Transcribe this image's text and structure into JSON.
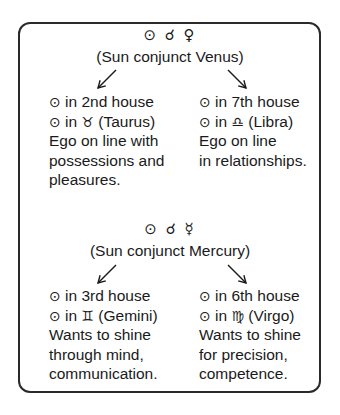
{
  "diagram": {
    "sections": [
      {
        "symbols": "⊙ ☌ ♀",
        "title": "(Sun conjunct Venus)",
        "left": {
          "house_glyph": "⊙",
          "house_text": " in 2nd house",
          "sign_glyph": "⊙",
          "sign_in": " in ",
          "sign_symbol": "♉",
          "sign_name": " (Taurus)",
          "description": [
            "Ego on line with",
            "possessions and",
            "pleasures."
          ]
        },
        "right": {
          "house_glyph": "⊙",
          "house_text": " in 7th house",
          "sign_glyph": "⊙",
          "sign_in": " in ",
          "sign_symbol": "♎",
          "sign_name": " (Libra)",
          "description": [
            "Ego on line",
            "in relationships."
          ]
        }
      },
      {
        "symbols": "⊙ ☌ ☿",
        "title": "(Sun conjunct Mercury)",
        "left": {
          "house_glyph": "⊙",
          "house_text": " in 3rd house",
          "sign_glyph": "⊙",
          "sign_in": " in ",
          "sign_symbol": "♊",
          "sign_name": " (Gemini)",
          "description": [
            "Wants to shine",
            "through mind,",
            "communication."
          ]
        },
        "right": {
          "house_glyph": "⊙",
          "house_text": " in 6th house",
          "sign_glyph": "⊙",
          "sign_in": " in ",
          "sign_symbol": "♍",
          "sign_name": " (Virgo)",
          "description": [
            "Wants to shine",
            "for precision,",
            "competence."
          ]
        }
      }
    ],
    "colors": {
      "ink": "#1a1a1a",
      "border": "#2a2a2a",
      "background": "#ffffff"
    }
  }
}
